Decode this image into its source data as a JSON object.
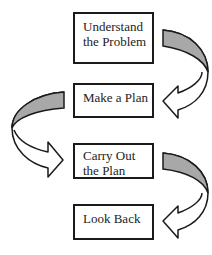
{
  "diagram": {
    "type": "flowchart",
    "steps": [
      {
        "label": "Understand\nthe Problem",
        "line1": "Understand",
        "line2": "the Problem"
      },
      {
        "label": "Make a Plan",
        "line1": "Make a Plan",
        "line2": ""
      },
      {
        "label": "Carry Out\nthe Plan",
        "line1": "Carry Out",
        "line2": "the Plan"
      },
      {
        "label": "Look Back",
        "line1": "Look Back",
        "line2": ""
      }
    ],
    "arrows": [
      {
        "from": 0,
        "to": 1,
        "side": "right"
      },
      {
        "from": 1,
        "to": 2,
        "side": "left"
      },
      {
        "from": 2,
        "to": 3,
        "side": "right"
      }
    ],
    "colors": {
      "arrow_fill": "#a8a8a8",
      "border": "#1a1a1a",
      "background": "#ffffff"
    }
  }
}
